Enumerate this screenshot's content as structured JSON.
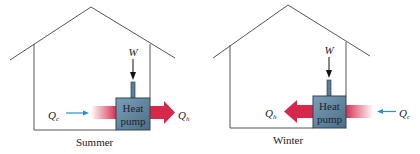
{
  "panels": [
    {
      "caption": "Summer",
      "pump_label_line1": "Heat",
      "pump_label_line2": "pump",
      "work_label": "W",
      "cold_label": "Q",
      "cold_sub": "c",
      "hot_label": "Q",
      "hot_sub": "h"
    },
    {
      "caption": "Winter",
      "pump_label_line1": "Heat",
      "pump_label_line2": "pump",
      "work_label": "W",
      "cold_label": "Q",
      "cold_sub": "c",
      "hot_label": "Q",
      "hot_sub": "h"
    }
  ],
  "colors": {
    "house_line": "#555555",
    "pump_fill": "#5a7f99",
    "pump_border": "#2f4454",
    "hot_arrow": "#d6284a",
    "cold_arrow": "#2a8fd0",
    "work_arrow": "#111111"
  }
}
